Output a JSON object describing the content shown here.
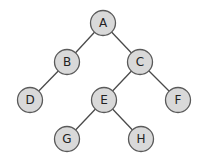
{
  "diagram": {
    "type": "binary-tree",
    "colors": {
      "background": "#ffffff",
      "node_fill": "#d9d9d9",
      "node_stroke": "#5a5a5a",
      "edge": "#4a4a4a",
      "label": "#222222"
    },
    "nodes": [
      {
        "id": "A",
        "label": "A",
        "x": 103,
        "y": 23
      },
      {
        "id": "B",
        "label": "B",
        "x": 67,
        "y": 62
      },
      {
        "id": "C",
        "label": "C",
        "x": 140,
        "y": 62
      },
      {
        "id": "D",
        "label": "D",
        "x": 30,
        "y": 100
      },
      {
        "id": "E",
        "label": "E",
        "x": 104,
        "y": 100
      },
      {
        "id": "F",
        "label": "F",
        "x": 178,
        "y": 100
      },
      {
        "id": "G",
        "label": "G",
        "x": 67,
        "y": 139
      },
      {
        "id": "H",
        "label": "H",
        "x": 141,
        "y": 139
      }
    ],
    "edges": [
      {
        "from": "A",
        "to": "B"
      },
      {
        "from": "A",
        "to": "C"
      },
      {
        "from": "B",
        "to": "D"
      },
      {
        "from": "C",
        "to": "E"
      },
      {
        "from": "C",
        "to": "F"
      },
      {
        "from": "E",
        "to": "G"
      },
      {
        "from": "E",
        "to": "H"
      }
    ]
  }
}
